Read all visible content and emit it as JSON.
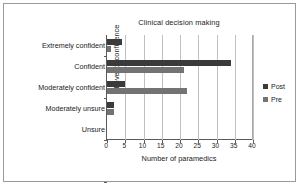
{
  "chart_data": {
    "type": "bar",
    "orientation": "horizontal",
    "title": "Clinical decision making",
    "xlabel": "Number of paramedics",
    "ylabel": "Level of confidence",
    "categories": [
      "Extremely confident",
      "Confident",
      "Moderately confident",
      "Moderately unsure",
      "Unsure"
    ],
    "series": [
      {
        "name": "Post",
        "color": "#3a3a3a",
        "values": [
          4,
          34,
          5,
          2,
          0
        ]
      },
      {
        "name": "Pre",
        "color": "#737373",
        "values": [
          1,
          21,
          22,
          2,
          0
        ]
      }
    ],
    "xlim": [
      0,
      40
    ],
    "xticks": [
      0,
      5,
      10,
      15,
      20,
      25,
      30,
      35,
      40
    ],
    "xtick_labels": [
      "0",
      "5",
      "10",
      "15",
      "20",
      "25",
      "30",
      "35",
      "40"
    ],
    "grid": "vertical",
    "legend_position": "right"
  }
}
